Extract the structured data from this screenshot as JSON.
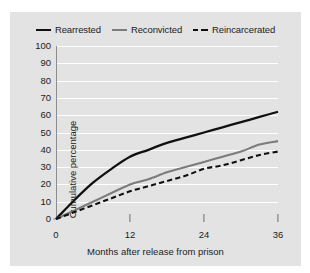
{
  "legend": {
    "position": "top-center",
    "items": [
      {
        "label": "Rearrested",
        "style": "solid",
        "color": "#101010",
        "name": "rearrested"
      },
      {
        "label": "Reconvicted",
        "style": "solid",
        "color": "#7c7c7c",
        "name": "reconvicted"
      },
      {
        "label": "Reincarcerated",
        "style": "dashed",
        "color": "#101010",
        "name": "reincarcerated"
      }
    ]
  },
  "axes": {
    "y_label": "Cumulative percentage",
    "x_label": "Months after release from prison",
    "y_ticks": [
      0,
      10,
      20,
      30,
      40,
      50,
      60,
      70,
      80,
      90,
      100
    ],
    "x_ticks": [
      0,
      12,
      24,
      36
    ]
  },
  "colors": {
    "panel": "#e3e3e3",
    "grid": "#ffffff",
    "axis": "#8d8d8d",
    "rearrested": "#101010",
    "reconvicted": "#7c7c7c",
    "reincarcerated": "#101010"
  },
  "chart_data": {
    "type": "line",
    "title": "",
    "xlabel": "Months after release from prison",
    "ylabel": "Cumulative percentage",
    "xlim": [
      0,
      36
    ],
    "ylim": [
      0,
      100
    ],
    "xticks": [
      0,
      12,
      24,
      36
    ],
    "yticks": [
      0,
      10,
      20,
      30,
      40,
      50,
      60,
      70,
      80,
      90,
      100
    ],
    "grid": "horizontal",
    "legend_position": "top-center",
    "x": [
      0,
      3,
      6,
      9,
      12,
      15,
      18,
      21,
      24,
      27,
      30,
      33,
      36
    ],
    "series": [
      {
        "name": "Rearrested",
        "style": "solid",
        "color": "#101010",
        "values": [
          0,
          11,
          21,
          29,
          36,
          40,
          44,
          47,
          50,
          53,
          56,
          59,
          62
        ]
      },
      {
        "name": "Reconvicted",
        "style": "solid",
        "color": "#7c7c7c",
        "values": [
          0,
          5,
          10,
          15,
          20,
          23,
          27,
          30,
          33,
          36,
          39,
          43,
          45
        ]
      },
      {
        "name": "Reincarcerated",
        "style": "dashed",
        "color": "#101010",
        "values": [
          0,
          4,
          8,
          12,
          16,
          19,
          22,
          25,
          29,
          31,
          34,
          37,
          39
        ]
      }
    ]
  }
}
